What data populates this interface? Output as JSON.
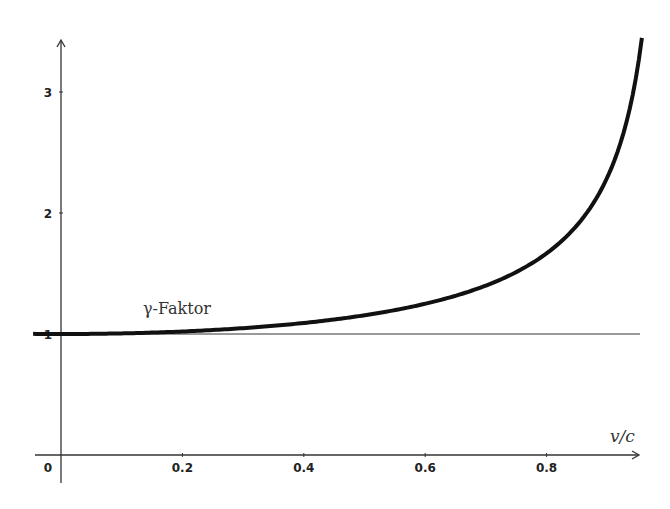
{
  "chart_data": {
    "type": "line",
    "title": "",
    "xlabel": "v/c",
    "ylabel": "",
    "xlim": [
      -0.046,
      0.95
    ],
    "ylim": [
      0,
      3.45
    ],
    "grid": false,
    "x_ticks": [
      {
        "value": 0,
        "label": "0"
      },
      {
        "value": 0.2,
        "label": "0.2"
      },
      {
        "value": 0.4,
        "label": "0.4"
      },
      {
        "value": 0.6,
        "label": "0.6"
      },
      {
        "value": 0.8,
        "label": "0.8"
      }
    ],
    "y_ticks": [
      {
        "value": 1,
        "label": "1"
      },
      {
        "value": 2,
        "label": "2"
      },
      {
        "value": 3,
        "label": "3"
      }
    ],
    "series": [
      {
        "name": "γ-Faktor",
        "formula": "1/sqrt(1-(v/c)^2)",
        "x": [
          -0.046,
          0,
          0.1,
          0.2,
          0.3,
          0.4,
          0.5,
          0.6,
          0.7,
          0.75,
          0.8,
          0.85,
          0.9,
          0.92,
          0.94,
          0.957
        ],
        "values": [
          1.001,
          1.0,
          1.005,
          1.021,
          1.048,
          1.091,
          1.155,
          1.25,
          1.4,
          1.512,
          1.667,
          1.898,
          2.294,
          2.552,
          2.931,
          3.44
        ],
        "color": "#111111",
        "stroke_width": 4
      },
      {
        "name": "reference line y=1",
        "x": [
          -0.046,
          0.95
        ],
        "values": [
          1,
          1
        ],
        "color": "#777777",
        "stroke_width": 1.3
      }
    ],
    "annotations": [
      {
        "text": "γ-Faktor",
        "x": 0.135,
        "y": 1.2
      }
    ]
  },
  "labels": {
    "x_axis_label": "v/c",
    "curve_label": "γ-Faktor"
  },
  "colors": {
    "curve": "#111111",
    "axis": "#333333",
    "reference_line": "#777777",
    "background": "#ffffff"
  }
}
